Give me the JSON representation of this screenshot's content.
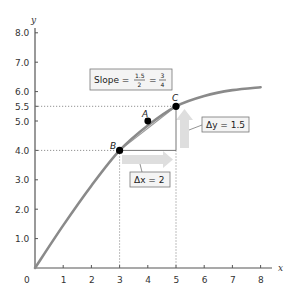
{
  "chart_data": {
    "type": "line",
    "title": "",
    "xlabel": "x",
    "ylabel": "y",
    "xlim": [
      0,
      8
    ],
    "ylim": [
      0,
      8
    ],
    "x_ticks": [
      "0",
      "1",
      "2",
      "3",
      "4",
      "5",
      "6",
      "7",
      "8"
    ],
    "y_ticks": [
      "1.0",
      "2.0",
      "3.0",
      "4.0",
      "5.0",
      "5.5",
      "6.0",
      "7.0",
      "8.0"
    ],
    "grid": false,
    "series": [
      {
        "name": "curve",
        "x": [
          0,
          1,
          2,
          3,
          4,
          5,
          6,
          7,
          8
        ],
        "y": [
          0,
          1.45,
          2.8,
          4.0,
          4.85,
          5.5,
          5.85,
          6.05,
          6.15
        ]
      },
      {
        "name": "chord BC",
        "x": [
          3,
          5
        ],
        "y": [
          4.0,
          5.5
        ]
      }
    ],
    "points": [
      {
        "label": "A",
        "x": 4,
        "y": 5.0
      },
      {
        "label": "B",
        "x": 3,
        "y": 4.0
      },
      {
        "label": "C",
        "x": 5,
        "y": 5.5
      }
    ],
    "annotations": [
      {
        "text": "Slope = 1.5/2 = 3/4",
        "slope_num": "1.5",
        "slope_den": "2",
        "result_num": "3",
        "result_den": "4"
      },
      {
        "text": "Δx = 2",
        "from_x": 3,
        "to_x": 5,
        "at_y": 4.0
      },
      {
        "text": "Δy = 1.5",
        "from_y": 4.0,
        "to_y": 5.5,
        "at_x": 5
      }
    ],
    "reference_lines": [
      {
        "type": "horizontal-dotted",
        "y": 5.5,
        "x_to": 5
      },
      {
        "type": "horizontal-dotted",
        "y": 4.0,
        "x_to": 3
      },
      {
        "type": "vertical-dotted",
        "x": 3,
        "y_to": 4.0
      },
      {
        "type": "vertical-dotted",
        "x": 5,
        "y_to": 5.5
      }
    ]
  },
  "labels": {
    "origin": "0",
    "x_axis": "x",
    "y_axis": "y",
    "point_a": "A",
    "point_b": "B",
    "point_c": "C",
    "slope_prefix": "Slope =",
    "slope_num": "1.5",
    "slope_den": "2",
    "slope_eq": "=",
    "slope_res_num": "3",
    "slope_res_den": "4",
    "delta_x": "Δx = 2",
    "delta_y": "Δy = 1.5"
  },
  "colors": {
    "curve": "#8a8a8a",
    "axis": "#555555",
    "arrow": "#dedede",
    "point": "#000000"
  }
}
